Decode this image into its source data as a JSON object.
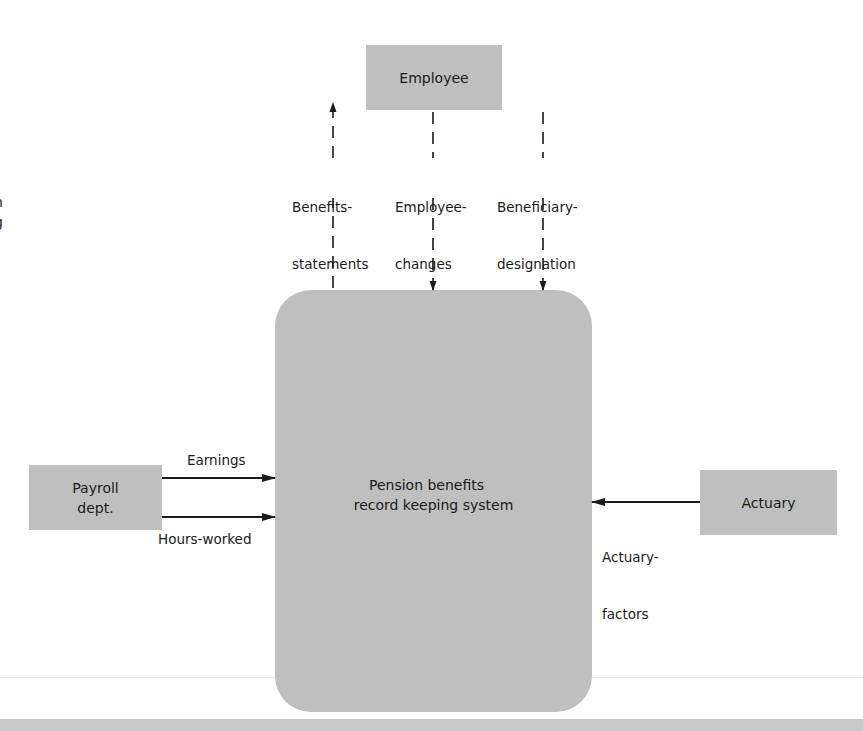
{
  "diagram": {
    "type": "context-data-flow-diagram",
    "colors": {
      "entity_fill": "#bfbfbf",
      "line": "#1a1a1a",
      "background": "#ffffff",
      "bottom_band": "#c8c8c8"
    },
    "central_process": {
      "label_line1": "Pension benefits",
      "label_line2": "record keeping system"
    },
    "entities": {
      "employee": {
        "label": "Employee"
      },
      "payroll": {
        "label_line1": "Payroll",
        "label_line2": "dept."
      },
      "actuary": {
        "label": "Actuary"
      }
    },
    "flows": {
      "benefits_statements": {
        "line1": "Benefits-",
        "line2": "statements",
        "from": "system",
        "to": "employee",
        "style": "dashed"
      },
      "employee_changes": {
        "line1": "Employee-",
        "line2": "changes",
        "from": "employee",
        "to": "system",
        "style": "dashed"
      },
      "beneficiary_designation": {
        "line1": "Beneficiary-",
        "line2": "designation",
        "from": "employee",
        "to": "system",
        "style": "dashed"
      },
      "earnings": {
        "label": "Earnings",
        "from": "payroll",
        "to": "system",
        "style": "solid"
      },
      "hours_worked": {
        "label": "Hours-worked",
        "from": "payroll",
        "to": "system",
        "style": "solid"
      },
      "actuary_factors": {
        "line1": "Actuary-",
        "line2": "factors",
        "from": "actuary",
        "to": "system",
        "style": "solid"
      }
    }
  }
}
